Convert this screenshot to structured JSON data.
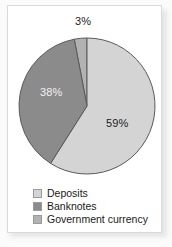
{
  "chart_data": {
    "type": "pie",
    "title": "",
    "subtitle": "",
    "xlabel": "",
    "ylabel": "",
    "legend_position": "bottom-left",
    "grid": false,
    "categories": [
      "Deposits",
      "Banknotes",
      "Government currency"
    ],
    "values": [
      59,
      38,
      3
    ],
    "unit": "%",
    "slices": [
      {
        "label": "Deposits",
        "value": 59,
        "data_label": "59%",
        "color": "#d4d4d4",
        "label_color": "#1d1d1d",
        "label_placement": "inside"
      },
      {
        "label": "Banknotes",
        "value": 38,
        "data_label": "38%",
        "color": "#8b8b8b",
        "label_color": "#f2f2f2",
        "label_placement": "inside"
      },
      {
        "label": "Government currency",
        "value": 3,
        "data_label": "3%",
        "color": "#b2b2b2",
        "label_color": "#1d1d1d",
        "label_placement": "outside-top"
      }
    ],
    "start_angle_deg": 0,
    "direction": "clockwise",
    "stroke_color": "#5a5a5a"
  },
  "legend": {
    "items": [
      {
        "label": "Deposits",
        "color": "#d4d4d4"
      },
      {
        "label": "Banknotes",
        "color": "#8b8b8b"
      },
      {
        "label": "Government currency",
        "color": "#b2b2b2"
      }
    ]
  },
  "colors": {
    "page_background": "#fbfbfb",
    "card_background": "#ffffff",
    "card_border": "#dadada",
    "deposits": "#d4d4d4",
    "banknotes": "#8b8b8b",
    "government_currency": "#b2b2b2",
    "slice_outline": "#5a5a5a",
    "text": "#1a1a1a"
  }
}
